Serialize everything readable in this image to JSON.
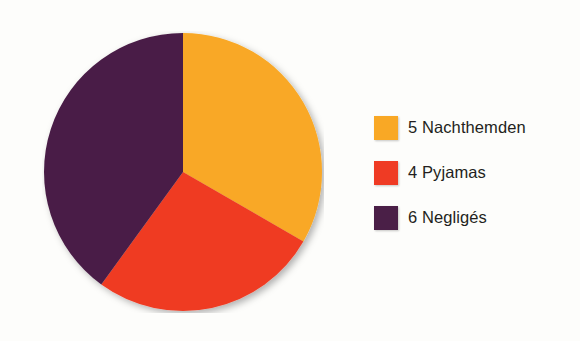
{
  "background_color": "#fdfdfb",
  "chart_data": {
    "type": "pie",
    "title": "",
    "subtitle": "",
    "xlabel": "",
    "ylabel": "",
    "grid": false,
    "legend_position": "right",
    "total": 15,
    "start_angle_deg": 0,
    "direction": "clockwise",
    "center": {
      "x": 183,
      "y": 172
    },
    "radius": 141,
    "categories": [
      "Nachthemden",
      "Pyjamas",
      "Negligés"
    ],
    "values": [
      5,
      4,
      6
    ],
    "labels": [
      "5 Nachthemden",
      "4 Pyjamas",
      "6 Negligés"
    ],
    "colors": [
      "#f9a825",
      "#ef3b24",
      "#4a1f47"
    ],
    "slices": [
      {
        "label": "5 Nachthemden",
        "category": "Nachthemden",
        "value": 5,
        "color": "#f9a825",
        "percent": 33.3,
        "start_angle_deg": 0,
        "end_angle_deg": 120,
        "sweep_deg": 120
      },
      {
        "label": "4 Pyjamas",
        "category": "Pyjamas",
        "value": 4,
        "color": "#ef3b24",
        "percent": 26.7,
        "start_angle_deg": 120,
        "end_angle_deg": 216,
        "sweep_deg": 96
      },
      {
        "label": "6 Negligés",
        "category": "Negligés",
        "value": 6,
        "color": "#4a1f47",
        "percent": 40.0,
        "start_angle_deg": 216,
        "end_angle_deg": 360,
        "sweep_deg": 144
      }
    ]
  },
  "legend": {
    "items": [
      {
        "label": "5 Nachthemden",
        "color": "#f9a825"
      },
      {
        "label": "4 Pyjamas",
        "color": "#ef3b24"
      },
      {
        "label": "6 Negligés",
        "color": "#4a1f47"
      }
    ]
  }
}
